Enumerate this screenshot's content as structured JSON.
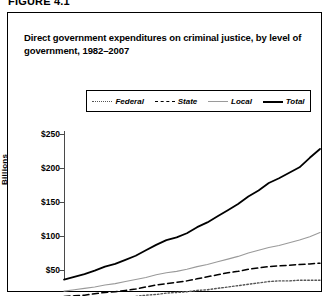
{
  "figure": {
    "number_label": "FIGURE 4.1",
    "title": "Direct government expenditures on criminal justice, by level of government, 1982–2007"
  },
  "legend": {
    "position": "top-center",
    "items": [
      {
        "label": "Federal",
        "style": "dotted",
        "color": "#555555",
        "name": "federal"
      },
      {
        "label": "State",
        "style": "dashed",
        "color": "#000000",
        "name": "state"
      },
      {
        "label": "Local",
        "style": "thin-solid",
        "color": "#9a9a9a",
        "name": "local"
      },
      {
        "label": "Total",
        "style": "thick-solid",
        "color": "#000000",
        "name": "total"
      }
    ]
  },
  "axes": {
    "y_title": "Billions",
    "y_ticks": [
      "$250",
      "$200",
      "$150",
      "$100",
      "$50"
    ],
    "x_axis_visible": false,
    "note": "bottom of figure including x-axis labels is cropped out of the screenshot"
  },
  "chart_data": {
    "type": "line",
    "title": "Direct government expenditures on criminal justice, by level of government, 1982–2007",
    "xlabel": "",
    "ylabel": "Billions",
    "ylim": [
      0,
      250
    ],
    "yticks": [
      50,
      100,
      150,
      200,
      250
    ],
    "ytick_labels": [
      "$50",
      "$100",
      "$150",
      "$200",
      "$250"
    ],
    "xlim": [
      1982,
      2007
    ],
    "grid": false,
    "legend_position": "top-center",
    "x": [
      1982,
      1983,
      1984,
      1985,
      1986,
      1987,
      1988,
      1989,
      1990,
      1991,
      1992,
      1993,
      1994,
      1995,
      1996,
      1997,
      1998,
      1999,
      2000,
      2001,
      2002,
      2003,
      2004,
      2005,
      2006,
      2007
    ],
    "series": [
      {
        "name": "Total",
        "style": "thick-solid",
        "color": "#000000",
        "values": [
          36,
          40,
          44,
          49,
          55,
          59,
          65,
          71,
          79,
          87,
          94,
          98,
          104,
          113,
          120,
          129,
          138,
          147,
          158,
          167,
          178,
          185,
          193,
          201,
          215,
          228
        ]
      },
      {
        "name": "Local",
        "style": "thin-solid",
        "color": "#9a9a9a",
        "values": [
          19,
          21,
          23,
          25,
          28,
          30,
          33,
          36,
          39,
          43,
          46,
          48,
          51,
          55,
          58,
          62,
          66,
          70,
          75,
          79,
          83,
          86,
          90,
          94,
          99,
          105
        ]
      },
      {
        "name": "State",
        "style": "dashed",
        "color": "#000000",
        "values": [
          11,
          12,
          13,
          15,
          17,
          18,
          20,
          22,
          25,
          28,
          30,
          32,
          34,
          37,
          40,
          43,
          46,
          48,
          51,
          53,
          55,
          56,
          57,
          58,
          59,
          60
        ]
      },
      {
        "name": "Federal",
        "style": "dotted",
        "color": "#555555",
        "values": [
          5,
          5,
          6,
          7,
          8,
          9,
          10,
          11,
          13,
          14,
          16,
          17,
          18,
          20,
          21,
          23,
          25,
          27,
          29,
          31,
          33,
          34,
          34,
          35,
          35,
          35
        ]
      }
    ]
  }
}
